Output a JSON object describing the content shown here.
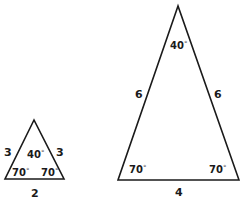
{
  "diagram": {
    "small_triangle": {
      "vertices": {
        "apex": [
          34,
          120
        ],
        "left": [
          5,
          179
        ],
        "right": [
          64,
          179
        ]
      },
      "sides": {
        "left": "3",
        "right": "3",
        "base": "2"
      },
      "angles": {
        "apex": "40",
        "left": "70",
        "right": "70"
      }
    },
    "large_triangle": {
      "vertices": {
        "apex": [
          178,
          6
        ],
        "left": [
          118,
          180
        ],
        "right": [
          239,
          180
        ]
      },
      "sides": {
        "left": "6",
        "right": "6",
        "base": "4"
      },
      "angles": {
        "apex": "40",
        "left": "70",
        "right": "70"
      }
    },
    "degree_symbol": "°",
    "colors": {
      "stroke": "#1a1a1a",
      "background": "#ffffff"
    }
  }
}
